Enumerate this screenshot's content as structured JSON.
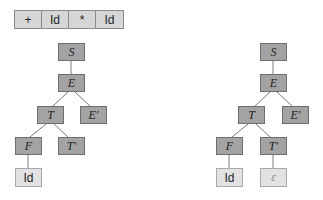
{
  "input_strip": {
    "tokens": [
      "+",
      "Id",
      "*",
      "Id"
    ]
  },
  "left_tree": {
    "nodes": {
      "S": "S",
      "E": "E",
      "T": "T",
      "E_prime": "E′",
      "F": "F",
      "T_prime": "T′",
      "Id": "Id"
    }
  },
  "right_tree": {
    "nodes": {
      "S": "S",
      "E": "E",
      "T": "T",
      "E_prime": "E′",
      "F": "F",
      "T_prime": "T′",
      "Id": "Id",
      "epsilon": "ε"
    }
  },
  "colors": {
    "nonterminal_fill": "#a3a3a3",
    "terminal_fill": "#e2e2e2",
    "strip_fill": "#d6d6d6",
    "edge": "#7a7a7a"
  }
}
